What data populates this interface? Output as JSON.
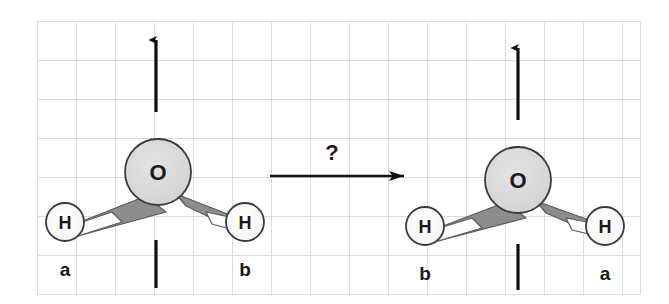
{
  "figure": {
    "background_color": "#ffffff",
    "grid": {
      "visible": true,
      "color": "#dcdcdc",
      "cell_size": 39,
      "origin_x": 37,
      "origin_y": 21,
      "cols": 16,
      "rows": 7
    },
    "colors": {
      "atom_fill_oxygen": "#d8d8d8",
      "atom_fill_hydrogen": "#fafafa",
      "atom_outline": "#3a3a3a",
      "bond_wedge_gray": "#8c8c8c",
      "bond_wedge_white": "#fcfcfc",
      "bond_outline": "#555555",
      "arrow_color": "#111111",
      "text_color": "#1a1a1a"
    }
  },
  "molecules": [
    {
      "name": "water-left",
      "side": "left",
      "center_atom": {
        "label": "O",
        "cx": 158,
        "cy": 172,
        "r": 33
      },
      "hydrogens": [
        {
          "label": "H",
          "cx": 65,
          "cy": 222,
          "r": 19,
          "group_label": "a",
          "group_x": 57,
          "group_y": 272
        },
        {
          "label": "H",
          "cx": 245,
          "cy": 222,
          "r": 19,
          "group_label": "b",
          "group_x": 238,
          "group_y": 272
        }
      ],
      "axis": {
        "name": "c2-rotation-axis",
        "x": 156,
        "arrow_top_y": 37,
        "arrow_bottom_y": 112,
        "stub_top_y": 240,
        "stub_bottom_y": 288
      }
    },
    {
      "name": "water-right",
      "side": "right",
      "center_atom": {
        "label": "O",
        "cx": 518,
        "cy": 180,
        "r": 33
      },
      "hydrogens": [
        {
          "label": "H",
          "cx": 425,
          "cy": 226,
          "r": 19,
          "group_label": "b",
          "group_x": 417,
          "group_y": 276
        },
        {
          "label": "H",
          "cx": 605,
          "cy": 226,
          "r": 19,
          "group_label": "a",
          "group_x": 598,
          "group_y": 276
        }
      ],
      "axis": {
        "name": "c2-rotation-axis",
        "x": 518,
        "arrow_top_y": 45,
        "arrow_bottom_y": 120,
        "stub_top_y": 244,
        "stub_bottom_y": 290
      }
    }
  ],
  "transformation": {
    "name": "reaction-arrow",
    "label": "?",
    "label_x": 332,
    "label_y": 158,
    "arrow_start_x": 270,
    "arrow_end_x": 412,
    "arrow_y": 176
  }
}
